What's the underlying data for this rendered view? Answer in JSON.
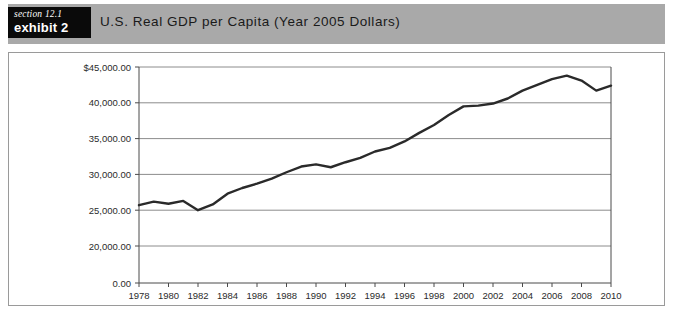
{
  "header": {
    "section_label": "section 12.1",
    "exhibit_label": "exhibit 2",
    "title": "U.S. Real GDP per Capita (Year 2005 Dollars)",
    "band_color": "#a9a9a9",
    "tag_bg_color": "#0a0a0a",
    "tag_text_color": "#ffffff"
  },
  "chart_data": {
    "type": "line",
    "title": "U.S. Real GDP per Capita (Year 2005 Dollars)",
    "xlabel": "",
    "ylabel": "",
    "grid": true,
    "legend": false,
    "line_color": "#2a2a2a",
    "x": [
      1978,
      1979,
      1980,
      1981,
      1982,
      1983,
      1984,
      1985,
      1986,
      1987,
      1988,
      1989,
      1990,
      1991,
      1992,
      1993,
      1994,
      1995,
      1996,
      1997,
      1998,
      1999,
      2000,
      2001,
      2002,
      2003,
      2004,
      2005,
      2006,
      2007,
      2008,
      2009,
      2010
    ],
    "values": [
      25700,
      26200,
      25900,
      26300,
      25000,
      25800,
      27300,
      28100,
      28700,
      29400,
      30300,
      31100,
      31400,
      31000,
      31700,
      32300,
      33200,
      33700,
      34600,
      35800,
      36900,
      38300,
      39500,
      39600,
      39900,
      40600,
      41700,
      42500,
      43300,
      43800,
      43100,
      41700,
      42400
    ],
    "ylim": [
      0,
      45000
    ],
    "y_ticks": [
      0,
      20000,
      25000,
      30000,
      35000,
      40000,
      45000
    ],
    "y_tick_labels": [
      "0.00",
      "20,000.00",
      "25,000.00",
      "30,000.00",
      "35,000.00",
      "40,000.00",
      "$45,000.00"
    ],
    "y_axis_note": "broken axis: gap between 0.00 and 20,000.00",
    "x_ticks": [
      1978,
      1980,
      1982,
      1984,
      1986,
      1988,
      1990,
      1992,
      1994,
      1996,
      1998,
      2000,
      2002,
      2004,
      2006,
      2008,
      2010
    ],
    "x_tick_labels": [
      "1978",
      "1980",
      "1982",
      "1984",
      "1986",
      "1988",
      "1990",
      "1992",
      "1994",
      "1996",
      "1998",
      "2000",
      "2002",
      "2004",
      "2006",
      "2008",
      "2010"
    ]
  }
}
